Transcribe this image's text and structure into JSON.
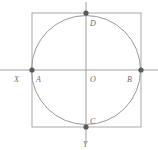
{
  "figure": {
    "canvas": {
      "width": 158,
      "height": 150,
      "background": "#ffffff"
    },
    "colors": {
      "square_stroke": "#a8a8a8",
      "circle_stroke": "#9a9a9a",
      "axis_stroke": "#a0a0a0",
      "point_fill": "#5a5a5a",
      "label_color": "#6e6e6e"
    },
    "square": {
      "name": "bounding-square",
      "x": 32,
      "y": 13,
      "width": 109,
      "height": 114,
      "stroke_width": 1
    },
    "circle": {
      "name": "inscribed-circle",
      "cx": 86,
      "cy": 70,
      "r": 54.5,
      "stroke_width": 1
    },
    "axes": [
      {
        "name": "x-axis",
        "orientation": "horizontal",
        "x1": 0,
        "y1": 70,
        "x2": 158,
        "y2": 70,
        "label": "X",
        "label_x": 14,
        "label_y": 82
      },
      {
        "name": "y-axis",
        "orientation": "vertical",
        "x1": 86,
        "y1": 2,
        "x2": 86,
        "y2": 143,
        "label": "Y",
        "label_x": 83,
        "label_y": 147
      }
    ],
    "points": [
      {
        "name": "point-a",
        "label": "A",
        "cx": 32,
        "cy": 70,
        "r": 2.6,
        "label_x": 36,
        "label_y": 82,
        "marked": true
      },
      {
        "name": "point-b",
        "label": "B",
        "cx": 141,
        "cy": 70,
        "r": 2.6,
        "label_x": 127,
        "label_y": 82,
        "marked": true
      },
      {
        "name": "point-c",
        "label": "C",
        "cx": 86,
        "cy": 127,
        "r": 2.6,
        "label_x": 90,
        "label_y": 124,
        "marked": true
      },
      {
        "name": "point-d",
        "label": "D",
        "cx": 86,
        "cy": 13,
        "r": 2.6,
        "label_x": 90,
        "label_y": 26,
        "marked": true
      },
      {
        "name": "point-o-origin",
        "label": "O",
        "cx": 86,
        "cy": 70,
        "r": 0,
        "label_x": 90,
        "label_y": 82,
        "marked": false
      }
    ]
  }
}
